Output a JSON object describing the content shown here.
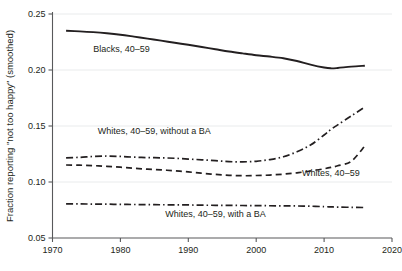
{
  "chart_data": {
    "type": "line",
    "title": "",
    "subtitle": "",
    "xlabel": "",
    "ylabel": "Fraction reporting \"not too happy\" (smoothed)",
    "xlim": [
      1970,
      2020
    ],
    "ylim": [
      0.05,
      0.25
    ],
    "grid": true,
    "legend_position": "inline-annotations",
    "xticks": [
      "1970",
      "1980",
      "1990",
      "2000",
      "2010",
      "2020"
    ],
    "xtick_values": [
      1970,
      1980,
      1990,
      2000,
      2010,
      2020
    ],
    "yticks": [
      "0.05",
      "0.10",
      "0.15",
      "0.20",
      "0.25"
    ],
    "ytick_values": [
      0.05,
      0.1,
      0.15,
      0.2,
      0.25
    ],
    "x": [
      1972,
      1974,
      1976,
      1978,
      1980,
      1982,
      1984,
      1986,
      1988,
      1990,
      1992,
      1994,
      1996,
      1998,
      2000,
      2002,
      2004,
      2006,
      2008,
      2010,
      2011,
      2012,
      2014,
      2016
    ],
    "series": [
      {
        "name": "Blacks, 40–59",
        "style": "solid",
        "label": "Blacks, 40–59",
        "label_x": 1976,
        "label_y": 0.216,
        "values": [
          0.235,
          0.2345,
          0.2338,
          0.2328,
          0.2315,
          0.2298,
          0.228,
          0.2262,
          0.2243,
          0.2225,
          0.2205,
          0.2185,
          0.2165,
          0.2148,
          0.2132,
          0.212,
          0.2105,
          0.208,
          0.2048,
          0.2022,
          0.2015,
          0.2018,
          0.203,
          0.2038
        ]
      },
      {
        "name": "Whites, 40–59, without a BA",
        "style": "dash-dot",
        "label": "Whites, 40–59, without a BA",
        "label_x": 1985,
        "label_y": 0.1425,
        "values": [
          0.1215,
          0.122,
          0.1228,
          0.1232,
          0.1228,
          0.1222,
          0.1218,
          0.1216,
          0.1212,
          0.1205,
          0.1198,
          0.119,
          0.1182,
          0.118,
          0.1185,
          0.12,
          0.1225,
          0.127,
          0.133,
          0.142,
          0.147,
          0.151,
          0.159,
          0.167
        ]
      },
      {
        "name": "Whites, 40–59",
        "style": "dashed",
        "label": "Whites, 40–59",
        "label_x": 2011,
        "label_y": 0.1055,
        "values": [
          0.1152,
          0.115,
          0.1146,
          0.114,
          0.1132,
          0.1122,
          0.1115,
          0.1108,
          0.11,
          0.109,
          0.1078,
          0.1068,
          0.106,
          0.1056,
          0.1058,
          0.1062,
          0.107,
          0.1082,
          0.1098,
          0.1118,
          0.113,
          0.1145,
          0.1185,
          0.1322
        ]
      },
      {
        "name": "Whites, 40–59, with a BA",
        "style": "dash-dot",
        "label": "Whites, 40–59, with a BA",
        "label_x": 1994,
        "label_y": 0.0688,
        "values": [
          0.0805,
          0.0804,
          0.0803,
          0.0802,
          0.08,
          0.0799,
          0.0798,
          0.0797,
          0.0796,
          0.0795,
          0.0793,
          0.0792,
          0.0791,
          0.079,
          0.0789,
          0.0788,
          0.0787,
          0.0786,
          0.0784,
          0.078,
          0.0778,
          0.0776,
          0.0774,
          0.0772
        ]
      }
    ]
  },
  "colors": {
    "line": "#231f20",
    "axis": "#58595b",
    "grid": "#e9ebec",
    "background": "#ffffff"
  }
}
